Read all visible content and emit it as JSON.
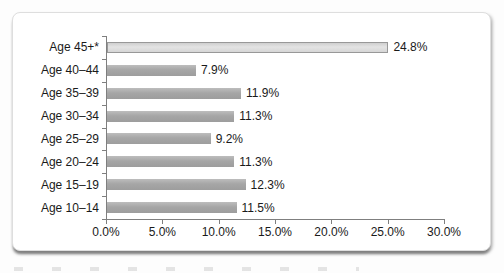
{
  "chart_data": {
    "type": "bar",
    "orientation": "horizontal",
    "title": "",
    "xlabel": "",
    "ylabel": "",
    "categories": [
      "Age 45+*",
      "Age 40–44",
      "Age 35–39",
      "Age 30–34",
      "Age 25–29",
      "Age 20–24",
      "Age 15–19",
      "Age 10–14"
    ],
    "values": [
      24.8,
      7.9,
      11.9,
      11.3,
      9.2,
      11.3,
      12.3,
      11.5
    ],
    "value_labels": [
      "24.8%",
      "7.9%",
      "11.9%",
      "11.3%",
      "9.2%",
      "11.3%",
      "12.3%",
      "11.5%"
    ],
    "x_tick_labels": [
      "0.0%",
      "5.0%",
      "10.0%",
      "15.0%",
      "20.0%",
      "25.0%",
      "30.0%"
    ],
    "xlim": [
      0,
      30
    ],
    "grid": false,
    "legend": false,
    "highlight_first_bar": true,
    "colors": {
      "bar": "#a6a6a6",
      "highlight_bar_fill": "#dcdcdc",
      "highlight_bar_border": "#989898",
      "axis": "#7f7f7f",
      "text": "#1a1a1a",
      "panel_background": "#ffffff",
      "panel_border": "#dedede"
    }
  }
}
